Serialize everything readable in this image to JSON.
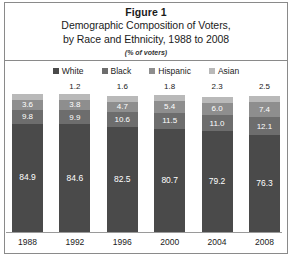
{
  "figure": {
    "number": "Figure 1",
    "title_line1": "Demographic Composition of Voters,",
    "title_line2": "by Race and Ethnicity, 1988 to 2008",
    "units": "(% of voters)"
  },
  "legend": {
    "items": [
      {
        "label": "White",
        "color": "#4a4a4a"
      },
      {
        "label": "Black",
        "color": "#6d6d6d"
      },
      {
        "label": "Hispanic",
        "color": "#8e8e8e"
      },
      {
        "label": "Asian",
        "color": "#b9b9b9"
      }
    ]
  },
  "chart_data": {
    "type": "bar",
    "stacked": true,
    "title": "Demographic Composition of Voters, by Race and Ethnicity, 1988 to 2008",
    "subtitle": "(% of voters)",
    "xlabel": "",
    "ylabel": "",
    "ylim": [
      0,
      100
    ],
    "grid": false,
    "legend_position": "top",
    "categories": [
      "1988",
      "1992",
      "1996",
      "2000",
      "2004",
      "2008"
    ],
    "series": [
      {
        "name": "White",
        "values": [
          "84.9",
          "84.6",
          "82.5",
          "80.7",
          "79.2",
          "76.3"
        ]
      },
      {
        "name": "Black",
        "values": [
          "9.8",
          "9.9",
          "10.6",
          "11.5",
          "11.0",
          "12.1"
        ]
      },
      {
        "name": "Hispanic",
        "values": [
          "3.6",
          "3.8",
          "4.7",
          "5.4",
          "6.0",
          "7.4"
        ]
      },
      {
        "name": "Asian",
        "values": [
          "",
          "1.2",
          "1.6",
          "1.8",
          "2.3",
          "2.5"
        ]
      }
    ]
  },
  "source": {
    "text": ""
  }
}
